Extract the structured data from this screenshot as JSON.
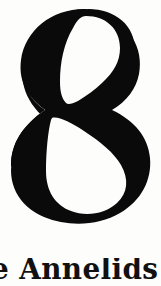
{
  "page": {
    "kind": "scanned-book-page-fragment",
    "width": 161,
    "height": 286,
    "background_color": "#fdfdfc",
    "ink_color": "#0a0a0a"
  },
  "chapter": {
    "number": "8",
    "number_glyph_name": "numeral-eight",
    "number_style": "didone-modern-serif",
    "number_color": "#0a0a0a",
    "heading": "e Annelids",
    "heading_full_guess": "The Annelids",
    "heading_color": "#111111",
    "heading_clipped": "bottom and left edges cropped"
  }
}
